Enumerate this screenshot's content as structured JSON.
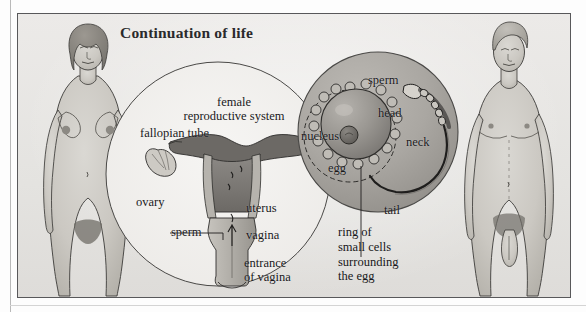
{
  "figure": {
    "title": "Continuation of life",
    "kind": "biology-textbook-plate",
    "palette": {
      "plate_background": "#e9e8e6",
      "frame_border": "#58585a",
      "ink": "#18181a",
      "skin_tone": "#cfcdc8",
      "skin_shadow": "#aeaba4",
      "hair_tone": "#8e8b85",
      "magnifier_fill": "#a9a7a2",
      "organ_dark": "#6f6d6a",
      "organ_mid": "#9b9894",
      "organ_light": "#c2bfb9",
      "egg_fill": "#97948f",
      "nucleus_fill": "#6d6a66"
    }
  },
  "labels": {
    "female_system": "female\nreproductive system",
    "fallopian_tube": "fallopian tube",
    "ovary": "ovary",
    "uterus": "uterus",
    "vagina": "vagina",
    "sperm_lower": "sperm",
    "entrance_of_vagina": "entrance\nof vagina",
    "sperm_upper": "sperm",
    "head": "head",
    "neck": "neck",
    "tail": "tail",
    "nucleus": "nucleus",
    "egg": "egg",
    "ring_caption": "ring of\nsmall cells\nsurrounding\nthe egg"
  },
  "figures": {
    "left_person": "adult female body, front view, anatomical illustration",
    "right_person": "adult male body, front view, anatomical illustration"
  },
  "diagram_parts": {
    "left_circle": "outlined circle containing the female reproductive system diagram",
    "right_circle": "shaded circle magnifying an egg cell with a sperm approaching"
  }
}
